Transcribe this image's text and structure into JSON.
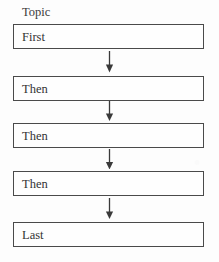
{
  "diagram": {
    "title_label": "Topic",
    "type": "vertical-flowchart",
    "canvas": {
      "width": 219,
      "height": 262
    },
    "colors": {
      "background": "#fdfdfd",
      "box_border": "#4a4a4a",
      "box_fill": "#fefefe",
      "text": "#333333",
      "arrow": "#3a3a3a"
    },
    "steps": [
      {
        "label": "First",
        "top": 24
      },
      {
        "label": "Then",
        "top": 76
      },
      {
        "label": "Then",
        "top": 123
      },
      {
        "label": "Then",
        "top": 171
      },
      {
        "label": "Last",
        "top": 222
      }
    ],
    "connectors": [
      {
        "name": "arrow-1",
        "top": 51,
        "direction": "down"
      },
      {
        "name": "arrow-2",
        "top": 99,
        "direction": "down"
      },
      {
        "name": "arrow-3",
        "top": 147,
        "direction": "down"
      },
      {
        "name": "arrow-4",
        "top": 197,
        "direction": "down"
      }
    ]
  }
}
